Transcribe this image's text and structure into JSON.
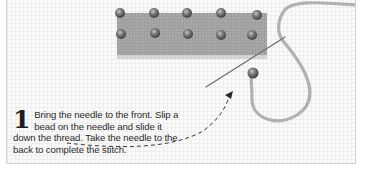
{
  "step": {
    "number": "1",
    "text": "Bring the needle to the front. Slip a bead on the needle and slide it down the thread. Take the needle to the back to complete the stitch."
  },
  "illustration": {
    "subject": "canvas with beaded stitches, needle and looped thread",
    "bead_rows": 2,
    "beads_per_row": 5,
    "arrow": "dashed curved arrow from caption to needle",
    "colors": {
      "canvas_grid": "#eeeeee",
      "stitched_area": "#8c8c8c",
      "bead": "#6a6a6a",
      "thread": "#a9a9a9",
      "needle": "#707070",
      "arrow": "#3a3a3a"
    }
  }
}
